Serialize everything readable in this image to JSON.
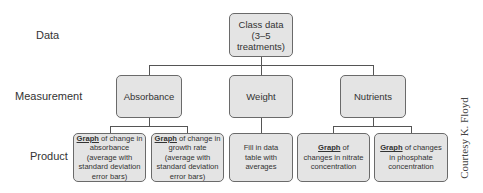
{
  "row_labels": {
    "data": "Data",
    "measurement": "Measurement",
    "product": "Product"
  },
  "root": {
    "line1": "Class data",
    "line2": "(3–5",
    "line3": "treatments)"
  },
  "measurements": [
    {
      "label": "Absorbance"
    },
    {
      "label": "Weight"
    },
    {
      "label": "Nutrients"
    }
  ],
  "products": [
    {
      "emph": "Graph",
      "rest": " of change in absorbance (average with standard deviation error bars)",
      "parent": "Absorbance"
    },
    {
      "emph": "Graph",
      "rest": " of change in growth rate (average with standard deviation error bars)",
      "parent": "Absorbance"
    },
    {
      "emph": "",
      "rest": "Fill in data table with averages",
      "parent": "Weight"
    },
    {
      "emph": "Graph",
      "rest": " of changes in nitrate concentration",
      "parent": "Nutrients"
    },
    {
      "emph": "Graph",
      "rest": " of changes in phosphate concentration",
      "parent": "Nutrients"
    }
  ],
  "credit": "Courtesy K. Floyd",
  "colors": {
    "box_fill": "#e4e4e4",
    "box_border": "#6a6a6a",
    "connector": "#555555",
    "text": "#333333"
  }
}
